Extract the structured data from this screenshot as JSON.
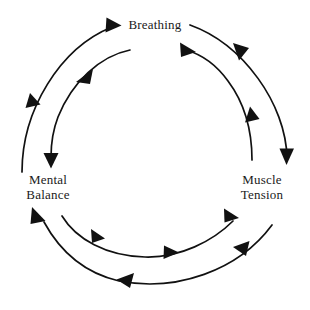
{
  "diagram": {
    "type": "cycle",
    "background_color": "#ffffff",
    "stroke_color": "#111111",
    "text_color": "#1a1a1a",
    "nodes": [
      {
        "id": "breathing",
        "label": "Breathing",
        "lines": [
          "Breathing"
        ],
        "position": "top"
      },
      {
        "id": "mental-balance",
        "label": "Mental Balance",
        "lines": [
          "Mental",
          "Balance"
        ],
        "position": "bottom-left"
      },
      {
        "id": "muscle-tension",
        "label": "Muscle Tension",
        "lines": [
          "Muscle",
          "Tension"
        ],
        "position": "bottom-right"
      }
    ],
    "rings": [
      {
        "id": "outer-ring",
        "direction": "counterclockwise",
        "arcs": [
          {
            "id": "outer-arc-breathing-to-muscle-tension",
            "from": "breathing",
            "to": "muscle-tension",
            "arrowheads": 2
          },
          {
            "id": "outer-arc-muscle-tension-to-mental-balance",
            "from": "muscle-tension",
            "to": "mental-balance",
            "arrowheads": 2
          },
          {
            "id": "outer-arc-mental-balance-to-breathing",
            "from": "mental-balance",
            "to": "breathing",
            "arrowheads": 2
          }
        ]
      },
      {
        "id": "inner-ring",
        "direction": "clockwise",
        "arcs": [
          {
            "id": "inner-arc-breathing-to-mental-balance",
            "from": "breathing",
            "to": "mental-balance",
            "arrowheads": 2
          },
          {
            "id": "inner-arc-mental-balance-to-muscle-tension",
            "from": "mental-balance",
            "to": "muscle-tension",
            "arrowheads": 3
          },
          {
            "id": "inner-arc-muscle-tension-to-breathing",
            "from": "muscle-tension",
            "to": "breathing",
            "arrowheads": 2
          }
        ]
      }
    ]
  }
}
